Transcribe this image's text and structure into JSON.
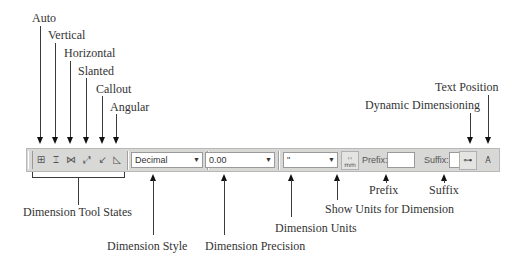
{
  "callouts": {
    "auto": "Auto",
    "vertical": "Vertical",
    "horizontal": "Horizontal",
    "slanted": "Slanted",
    "callout": "Callout",
    "angular": "Angular",
    "text_position": "Text Position",
    "dynamic_dimensioning": "Dynamic Dimensioning",
    "prefix": "Prefix",
    "suffix": "Suffix",
    "show_units": "Show Units for Dimension",
    "dimension_units": "Dimension Units",
    "dimension_tool_states": "Dimension Tool States",
    "dimension_style": "Dimension Style",
    "dimension_precision": "Dimension Precision"
  },
  "toolbar": {
    "tools": [
      {
        "name": "auto",
        "glyph": "⊞"
      },
      {
        "name": "vertical",
        "glyph": "⌶"
      },
      {
        "name": "horizontal",
        "glyph": "⋈"
      },
      {
        "name": "slanted",
        "glyph": "⤢"
      },
      {
        "name": "callout",
        "glyph": "↙"
      },
      {
        "name": "angular",
        "glyph": "◺"
      }
    ],
    "style_value": "Decimal",
    "precision_value": "0.00",
    "units_value": "\"",
    "show_units_glyph_top": "››",
    "show_units_glyph_bottom": "mm",
    "prefix_label": "Prefix:",
    "prefix_value": "",
    "suffix_label": "Suffix:",
    "suffix_value": "",
    "dynamic_glyph": "⊶",
    "text_position_glyph": "A"
  }
}
